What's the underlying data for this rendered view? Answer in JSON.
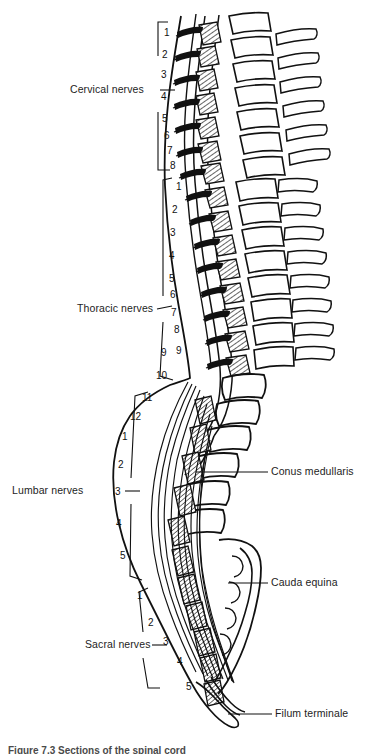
{
  "figure": {
    "caption_partial": "Figure 7.3 Sections of the spinal cord"
  },
  "regions": [
    {
      "id": "cervical",
      "label": "Cervical nerves",
      "count": 8,
      "numbers": [
        "1",
        "2",
        "3",
        "4",
        "5",
        "6",
        "7",
        "8"
      ]
    },
    {
      "id": "thoracic",
      "label": "Thoracic nerves",
      "count": 12,
      "numbers": [
        "1",
        "2",
        "3",
        "4",
        "5",
        "6",
        "7",
        "8",
        "9",
        "10",
        "11",
        "12"
      ]
    },
    {
      "id": "lumbar",
      "label": "Lumbar nerves",
      "count": 5,
      "numbers": [
        "1",
        "2",
        "3",
        "4",
        "5"
      ]
    },
    {
      "id": "sacral",
      "label": "Sacral nerves",
      "count": 5,
      "numbers": [
        "1",
        "2",
        "3",
        "4",
        "5"
      ]
    }
  ],
  "callouts": [
    {
      "id": "conus",
      "label": "Conus medullaris"
    },
    {
      "id": "cauda",
      "label": "Cauda equina"
    },
    {
      "id": "filum",
      "label": "Filum terminale"
    }
  ],
  "colors": {
    "ink": "#111111",
    "background": "#ffffff",
    "text": "#1d1d1d",
    "caption": "#4a4a4a"
  }
}
